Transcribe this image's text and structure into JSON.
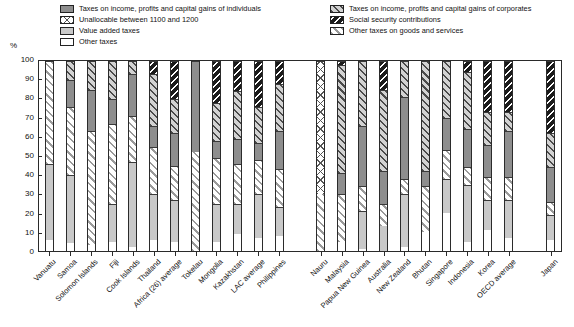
{
  "axis": {
    "y_unit": "%",
    "y_ticks": [
      "100",
      "90",
      "80",
      "70",
      "60",
      "50",
      "40",
      "30",
      "20",
      "10",
      "0"
    ]
  },
  "legend": {
    "left": [
      {
        "key": "individuals",
        "label": "Taxes on income, profits and capital gains of individuals",
        "pattern": "p-ind"
      },
      {
        "key": "unallocable",
        "label": "Unallocable between 1100 and 1200",
        "pattern": "p-unalloc"
      },
      {
        "key": "vat",
        "label": "Value added taxes",
        "pattern": "p-vat"
      },
      {
        "key": "other",
        "label": "Other taxes",
        "pattern": "p-other"
      }
    ],
    "right": [
      {
        "key": "corporates",
        "label": "Taxes on income, profits and capital gains of corporates",
        "pattern": "p-corp"
      },
      {
        "key": "ssc",
        "label": "Social security contributions",
        "pattern": "p-ssc"
      },
      {
        "key": "goods",
        "label": "Other taxes on goods and services",
        "pattern": "p-goods"
      }
    ]
  },
  "chart_data": {
    "type": "bar",
    "subtype": "stacked-100-percent",
    "title": "",
    "xlabel": "",
    "ylabel": "%",
    "ylim": [
      0,
      100
    ],
    "yticks": [
      0,
      10,
      20,
      30,
      40,
      50,
      60,
      70,
      80,
      90,
      100
    ],
    "grid": false,
    "legend_position": "top",
    "stack_order": [
      "other",
      "vat",
      "goods",
      "unallocable",
      "individuals",
      "corporates",
      "ssc"
    ],
    "series": [
      {
        "name": "Other taxes",
        "key": "other",
        "pattern": "p-other"
      },
      {
        "name": "Value added taxes",
        "key": "vat",
        "pattern": "p-vat"
      },
      {
        "name": "Other taxes on goods and services",
        "key": "goods",
        "pattern": "p-goods"
      },
      {
        "name": "Unallocable between 1100 and 1200",
        "key": "unallocable",
        "pattern": "p-unalloc"
      },
      {
        "name": "Taxes on income, profits and capital gains of individuals",
        "key": "individuals",
        "pattern": "p-ind"
      },
      {
        "name": "Taxes on income, profits and capital gains of corporates",
        "key": "corporates",
        "pattern": "p-corp"
      },
      {
        "name": "Social security contributions",
        "key": "ssc",
        "pattern": "p-ssc"
      }
    ],
    "categories": [
      "Vanuatu",
      "Samoa",
      "Solomon Islands",
      "Fiji",
      "Cook Islands",
      "Thailand",
      "Africa (26) average",
      "Tokelau",
      "Mongolia",
      "Kazakhstan",
      "LAC average",
      "Philippines",
      "GAP",
      "Nauru",
      "Malaysia",
      "Papua New Guinea",
      "Australia",
      "New Zealand",
      "Bhutan",
      "Singapore",
      "Indonesia",
      "Korea",
      "OECD average",
      "GAP2",
      "Japan"
    ],
    "bars": [
      {
        "category": "Vanuatu",
        "gap": false,
        "segments": [
          {
            "key": "other",
            "value": 6
          },
          {
            "key": "vat",
            "value": 40
          },
          {
            "key": "goods",
            "value": 54
          },
          {
            "key": "individuals",
            "value": 0
          },
          {
            "key": "corporates",
            "value": 0
          },
          {
            "key": "ssc",
            "value": 0
          }
        ]
      },
      {
        "category": "Samoa",
        "gap": false,
        "segments": [
          {
            "key": "other",
            "value": 4
          },
          {
            "key": "vat",
            "value": 36
          },
          {
            "key": "goods",
            "value": 36
          },
          {
            "key": "individuals",
            "value": 14
          },
          {
            "key": "corporates",
            "value": 10
          },
          {
            "key": "ssc",
            "value": 0
          }
        ]
      },
      {
        "category": "Solomon Islands",
        "gap": false,
        "segments": [
          {
            "key": "other",
            "value": 3
          },
          {
            "key": "vat",
            "value": 0
          },
          {
            "key": "goods",
            "value": 60
          },
          {
            "key": "individuals",
            "value": 22
          },
          {
            "key": "corporates",
            "value": 15
          },
          {
            "key": "ssc",
            "value": 0
          }
        ]
      },
      {
        "category": "Fiji",
        "gap": false,
        "segments": [
          {
            "key": "other",
            "value": 5
          },
          {
            "key": "vat",
            "value": 20
          },
          {
            "key": "goods",
            "value": 42
          },
          {
            "key": "individuals",
            "value": 13
          },
          {
            "key": "corporates",
            "value": 20
          },
          {
            "key": "ssc",
            "value": 0
          }
        ]
      },
      {
        "category": "Cook Islands",
        "gap": false,
        "segments": [
          {
            "key": "other",
            "value": 2
          },
          {
            "key": "vat",
            "value": 45
          },
          {
            "key": "goods",
            "value": 24
          },
          {
            "key": "individuals",
            "value": 22
          },
          {
            "key": "corporates",
            "value": 7
          },
          {
            "key": "ssc",
            "value": 0
          }
        ]
      },
      {
        "category": "Thailand",
        "gap": false,
        "segments": [
          {
            "key": "other",
            "value": 6
          },
          {
            "key": "vat",
            "value": 24
          },
          {
            "key": "goods",
            "value": 25
          },
          {
            "key": "individuals",
            "value": 11
          },
          {
            "key": "corporates",
            "value": 27
          },
          {
            "key": "ssc",
            "value": 7
          }
        ]
      },
      {
        "category": "Africa (26) average",
        "gap": false,
        "segments": [
          {
            "key": "other",
            "value": 5
          },
          {
            "key": "vat",
            "value": 22
          },
          {
            "key": "goods",
            "value": 18
          },
          {
            "key": "individuals",
            "value": 17
          },
          {
            "key": "corporates",
            "value": 18
          },
          {
            "key": "ssc",
            "value": 20
          }
        ]
      },
      {
        "category": "Tokelau",
        "gap": false,
        "segments": [
          {
            "key": "other",
            "value": 0
          },
          {
            "key": "vat",
            "value": 0
          },
          {
            "key": "goods",
            "value": 52
          },
          {
            "key": "individuals",
            "value": 48
          },
          {
            "key": "corporates",
            "value": 0
          },
          {
            "key": "ssc",
            "value": 0
          }
        ]
      },
      {
        "category": "Mongolia",
        "gap": false,
        "segments": [
          {
            "key": "other",
            "value": 5
          },
          {
            "key": "vat",
            "value": 20
          },
          {
            "key": "goods",
            "value": 24
          },
          {
            "key": "individuals",
            "value": 9
          },
          {
            "key": "corporates",
            "value": 20
          },
          {
            "key": "ssc",
            "value": 22
          }
        ]
      },
      {
        "category": "Kazakhstan",
        "gap": false,
        "segments": [
          {
            "key": "other",
            "value": 9
          },
          {
            "key": "vat",
            "value": 16
          },
          {
            "key": "goods",
            "value": 21
          },
          {
            "key": "individuals",
            "value": 13
          },
          {
            "key": "corporates",
            "value": 25
          },
          {
            "key": "ssc",
            "value": 16
          }
        ]
      },
      {
        "category": "LAC average",
        "gap": false,
        "segments": [
          {
            "key": "other",
            "value": 7
          },
          {
            "key": "vat",
            "value": 23
          },
          {
            "key": "goods",
            "value": 18
          },
          {
            "key": "individuals",
            "value": 9
          },
          {
            "key": "corporates",
            "value": 19
          },
          {
            "key": "ssc",
            "value": 24
          }
        ]
      },
      {
        "category": "Philippines",
        "gap": false,
        "segments": [
          {
            "key": "other",
            "value": 8
          },
          {
            "key": "vat",
            "value": 15
          },
          {
            "key": "goods",
            "value": 20
          },
          {
            "key": "individuals",
            "value": 20
          },
          {
            "key": "corporates",
            "value": 25
          },
          {
            "key": "ssc",
            "value": 12
          }
        ]
      },
      {
        "category": "GAP",
        "gap": true,
        "segments": []
      },
      {
        "category": "Nauru",
        "gap": false,
        "segments": [
          {
            "key": "other",
            "value": 0
          },
          {
            "key": "vat",
            "value": 0
          },
          {
            "key": "goods",
            "value": 30
          },
          {
            "key": "unallocable",
            "value": 70
          },
          {
            "key": "individuals",
            "value": 0
          },
          {
            "key": "corporates",
            "value": 0
          },
          {
            "key": "ssc",
            "value": 0
          }
        ]
      },
      {
        "category": "Malaysia",
        "gap": false,
        "segments": [
          {
            "key": "other",
            "value": 5
          },
          {
            "key": "vat",
            "value": 0
          },
          {
            "key": "goods",
            "value": 25
          },
          {
            "key": "individuals",
            "value": 11
          },
          {
            "key": "corporates",
            "value": 57
          },
          {
            "key": "ssc",
            "value": 2
          }
        ]
      },
      {
        "category": "Papua New Guinea",
        "gap": false,
        "segments": [
          {
            "key": "other",
            "value": 1
          },
          {
            "key": "vat",
            "value": 20
          },
          {
            "key": "goods",
            "value": 13
          },
          {
            "key": "individuals",
            "value": 32
          },
          {
            "key": "corporates",
            "value": 34
          },
          {
            "key": "ssc",
            "value": 0
          }
        ]
      },
      {
        "category": "Australia",
        "gap": false,
        "segments": [
          {
            "key": "other",
            "value": 0
          },
          {
            "key": "vat",
            "value": 13
          },
          {
            "key": "goods",
            "value": 12
          },
          {
            "key": "individuals",
            "value": 17
          },
          {
            "key": "corporates",
            "value": 43
          },
          {
            "key": "ssc",
            "value": 15
          }
        ]
      },
      {
        "category": "New Zealand",
        "gap": false,
        "segments": [
          {
            "key": "other",
            "value": 2
          },
          {
            "key": "vat",
            "value": 28
          },
          {
            "key": "goods",
            "value": 8
          },
          {
            "key": "individuals",
            "value": 43
          },
          {
            "key": "corporates",
            "value": 19
          },
          {
            "key": "ssc",
            "value": 0
          }
        ]
      },
      {
        "category": "Bhutan",
        "gap": false,
        "segments": [
          {
            "key": "other",
            "value": 10
          },
          {
            "key": "vat",
            "value": 0
          },
          {
            "key": "goods",
            "value": 24
          },
          {
            "key": "individuals",
            "value": 8
          },
          {
            "key": "corporates",
            "value": 58
          },
          {
            "key": "ssc",
            "value": 0
          }
        ]
      },
      {
        "category": "Singapore",
        "gap": false,
        "segments": [
          {
            "key": "other",
            "value": 20
          },
          {
            "key": "vat",
            "value": 18
          },
          {
            "key": "goods",
            "value": 15
          },
          {
            "key": "individuals",
            "value": 17
          },
          {
            "key": "corporates",
            "value": 30
          },
          {
            "key": "ssc",
            "value": 0
          }
        ]
      },
      {
        "category": "Indonesia",
        "gap": false,
        "segments": [
          {
            "key": "other",
            "value": 5
          },
          {
            "key": "vat",
            "value": 30
          },
          {
            "key": "goods",
            "value": 9
          },
          {
            "key": "individuals",
            "value": 20
          },
          {
            "key": "corporates",
            "value": 30
          },
          {
            "key": "ssc",
            "value": 6
          }
        ]
      },
      {
        "category": "Korea",
        "gap": false,
        "segments": [
          {
            "key": "other",
            "value": 11
          },
          {
            "key": "vat",
            "value": 16
          },
          {
            "key": "goods",
            "value": 12
          },
          {
            "key": "individuals",
            "value": 17
          },
          {
            "key": "corporates",
            "value": 17
          },
          {
            "key": "ssc",
            "value": 27
          }
        ]
      },
      {
        "category": "OECD average",
        "gap": false,
        "segments": [
          {
            "key": "other",
            "value": 7
          },
          {
            "key": "vat",
            "value": 20
          },
          {
            "key": "goods",
            "value": 12
          },
          {
            "key": "individuals",
            "value": 24
          },
          {
            "key": "corporates",
            "value": 10
          },
          {
            "key": "ssc",
            "value": 27
          }
        ]
      },
      {
        "category": "GAP2",
        "gap": true,
        "segments": []
      },
      {
        "category": "Japan",
        "gap": false,
        "segments": [
          {
            "key": "other",
            "value": 6
          },
          {
            "key": "vat",
            "value": 13
          },
          {
            "key": "goods",
            "value": 7
          },
          {
            "key": "individuals",
            "value": 18
          },
          {
            "key": "corporates",
            "value": 18
          },
          {
            "key": "ssc",
            "value": 38
          }
        ]
      }
    ]
  }
}
